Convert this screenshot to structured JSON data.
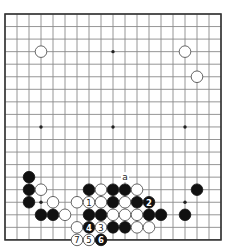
{
  "diagram": {
    "type": "go-board",
    "size": 19,
    "star_points": [
      [
        3,
        3
      ],
      [
        9,
        3
      ],
      [
        15,
        3
      ],
      [
        3,
        9
      ],
      [
        9,
        9
      ],
      [
        15,
        9
      ],
      [
        3,
        15
      ],
      [
        9,
        15
      ],
      [
        15,
        15
      ]
    ],
    "stones": [
      {
        "color": "white",
        "col": 3,
        "row": 3
      },
      {
        "color": "white",
        "col": 15,
        "row": 3
      },
      {
        "color": "white",
        "col": 16,
        "row": 5
      },
      {
        "color": "black",
        "col": 2,
        "row": 13
      },
      {
        "color": "black",
        "col": 2,
        "row": 14
      },
      {
        "color": "white",
        "col": 3,
        "row": 14
      },
      {
        "color": "black",
        "col": 2,
        "row": 15
      },
      {
        "color": "white",
        "col": 4,
        "row": 15
      },
      {
        "color": "black",
        "col": 3,
        "row": 16
      },
      {
        "color": "black",
        "col": 4,
        "row": 16
      },
      {
        "color": "white",
        "col": 5,
        "row": 16
      },
      {
        "color": "black",
        "col": 7,
        "row": 14
      },
      {
        "color": "white",
        "col": 8,
        "row": 14
      },
      {
        "color": "black",
        "col": 9,
        "row": 14
      },
      {
        "color": "black",
        "col": 10,
        "row": 14
      },
      {
        "color": "white",
        "col": 11,
        "row": 14
      },
      {
        "color": "white",
        "col": 6,
        "row": 15
      },
      {
        "color": "white",
        "col": 7,
        "row": 15,
        "label": "1"
      },
      {
        "color": "white",
        "col": 8,
        "row": 15
      },
      {
        "color": "black",
        "col": 9,
        "row": 15
      },
      {
        "color": "white",
        "col": 10,
        "row": 15
      },
      {
        "color": "black",
        "col": 11,
        "row": 15
      },
      {
        "color": "black",
        "col": 12,
        "row": 15,
        "label": "2"
      },
      {
        "color": "black",
        "col": 7,
        "row": 16
      },
      {
        "color": "black",
        "col": 8,
        "row": 16
      },
      {
        "color": "white",
        "col": 9,
        "row": 16
      },
      {
        "color": "white",
        "col": 10,
        "row": 16
      },
      {
        "color": "white",
        "col": 11,
        "row": 16
      },
      {
        "color": "black",
        "col": 12,
        "row": 16
      },
      {
        "color": "black",
        "col": 13,
        "row": 16
      },
      {
        "color": "black",
        "col": 15,
        "row": 16
      },
      {
        "color": "black",
        "col": 16,
        "row": 14
      },
      {
        "color": "white",
        "col": 6,
        "row": 17
      },
      {
        "color": "black",
        "col": 7,
        "row": 17,
        "label": "4"
      },
      {
        "color": "white",
        "col": 8,
        "row": 17,
        "label": "3"
      },
      {
        "color": "black",
        "col": 9,
        "row": 17
      },
      {
        "color": "black",
        "col": 10,
        "row": 17
      },
      {
        "color": "white",
        "col": 11,
        "row": 17
      },
      {
        "color": "white",
        "col": 12,
        "row": 17
      },
      {
        "color": "white",
        "col": 6,
        "row": 18,
        "label": "7"
      },
      {
        "color": "white",
        "col": 7,
        "row": 18,
        "label": "5"
      },
      {
        "color": "black",
        "col": 8,
        "row": 18,
        "label": "6"
      }
    ],
    "markers": [
      {
        "col": 10,
        "row": 13,
        "label": "a"
      }
    ]
  }
}
